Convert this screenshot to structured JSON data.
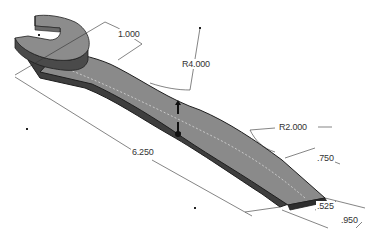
{
  "drawing": {
    "subject": "Wrench 3D model with dimensions",
    "colors": {
      "background": "#ffffff",
      "body_top": "#8a8a8a",
      "body_side": "#4a4a4a",
      "edge": "#1e1e1e",
      "dimension_line": "#333333"
    },
    "dimensions": [
      {
        "id": "head_width",
        "label": "1.000"
      },
      {
        "id": "large_radius",
        "label": "R4.000"
      },
      {
        "id": "overall_length",
        "label": "6.250"
      },
      {
        "id": "small_radius",
        "label": "R2.000"
      },
      {
        "id": "end_width",
        "label": ".750"
      },
      {
        "id": "end_inner_width",
        "label": ".525"
      },
      {
        "id": "end_outer_width",
        "label": ".950"
      }
    ]
  }
}
